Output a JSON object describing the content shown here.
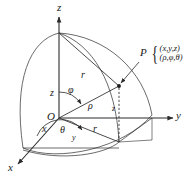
{
  "figure": {
    "background_color": "#ffffff",
    "line_color": "#2b2b2b",
    "text_color": "#1a1a1a"
  },
  "axes": [
    {
      "name": "z-axis",
      "label": "z",
      "direction": "up"
    },
    {
      "name": "y-axis",
      "label": "y",
      "direction": "right"
    },
    {
      "name": "x-axis",
      "label": "x",
      "direction": "down-left"
    }
  ],
  "origin": {
    "label": "O"
  },
  "point": {
    "marker_label": "P",
    "rectangular": "(x,y,z)",
    "spherical": "(ρ,φ,θ)",
    "brace": "{"
  },
  "labels": {
    "radius_upper": "r",
    "radius_lower": "r",
    "height_z_axis": "z",
    "height_z_drop": "z",
    "rho": "ρ",
    "phi": "φ",
    "theta": "θ",
    "y_segment": "y",
    "x_segment": "x"
  }
}
